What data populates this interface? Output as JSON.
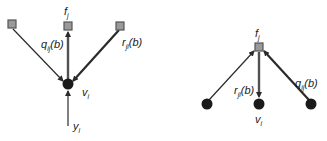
{
  "diagram": {
    "type": "factor-graph message passing",
    "left_panel": {
      "description": "variable-to-factor message",
      "variable_node": {
        "name": "v",
        "subscript": "i"
      },
      "observation": {
        "name": "y",
        "subscript": "i"
      },
      "factor_nodes": 3,
      "focus_factor": {
        "name": "f",
        "subscript": "j"
      },
      "outgoing_message": {
        "name": "q",
        "subscript": "ij",
        "arg": "(b)"
      },
      "incoming_message": {
        "name": "r",
        "subscript": "ji",
        "arg": "(b)"
      }
    },
    "right_panel": {
      "description": "factor-to-variable message",
      "factor_node": {
        "name": "f",
        "subscript": "j"
      },
      "variable_nodes": 3,
      "focus_variable": {
        "name": "v",
        "subscript": "i"
      },
      "outgoing_message": {
        "name": "r",
        "subscript": "ji",
        "arg": "(b)"
      },
      "incoming_message": {
        "name": "q",
        "subscript": "ij",
        "arg": "(b)"
      }
    },
    "colors": {
      "factor_fill": "#9a9a9a",
      "variable_fill": "#1a1a1a",
      "edge": "#2a2a2a"
    }
  }
}
